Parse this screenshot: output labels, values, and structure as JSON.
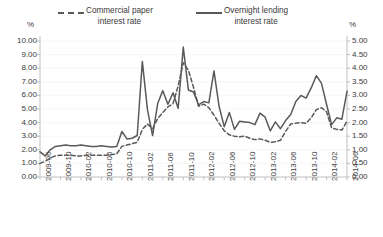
{
  "chart_data": {
    "type": "line",
    "title": "",
    "xlabel": "",
    "ylabel": "%",
    "y2label": "%",
    "grid": false,
    "legend_position": "top",
    "ylim": [
      0,
      10
    ],
    "y2lim": [
      0,
      5
    ],
    "yticks": [
      "0.00",
      "1.00",
      "2.00",
      "3.00",
      "4.00",
      "5.00",
      "6.00",
      "7.00",
      "8.00",
      "9.00",
      "10.00"
    ],
    "y2ticks": [
      "0.00",
      "0.50",
      "1.00",
      "1.50",
      "2.00",
      "2.50",
      "3.00",
      "3.50",
      "4.00",
      "4.50",
      "5.00"
    ],
    "xticklabels": [
      "2009-06",
      "2009-10",
      "2010-02",
      "2010-06",
      "2010-10",
      "2011-02",
      "2011-06",
      "2011-10",
      "2012-02",
      "2012-06",
      "2012-10",
      "2013-02",
      "2013-06",
      "2013-10",
      "2014-02",
      "2014-06"
    ],
    "x": [
      "2009-06",
      "2009-07",
      "2009-08",
      "2009-09",
      "2009-10",
      "2009-11",
      "2009-12",
      "2010-01",
      "2010-02",
      "2010-03",
      "2010-04",
      "2010-05",
      "2010-06",
      "2010-07",
      "2010-08",
      "2010-09",
      "2010-10",
      "2010-11",
      "2010-12",
      "2011-01",
      "2011-02",
      "2011-03",
      "2011-04",
      "2011-05",
      "2011-06",
      "2011-07",
      "2011-08",
      "2011-09",
      "2011-10",
      "2011-11",
      "2011-12",
      "2012-01",
      "2012-02",
      "2012-03",
      "2012-04",
      "2012-05",
      "2012-06",
      "2012-07",
      "2012-08",
      "2012-09",
      "2012-10",
      "2012-11",
      "2012-12",
      "2013-01",
      "2013-02",
      "2013-03",
      "2013-04",
      "2013-05",
      "2013-06",
      "2013-07",
      "2013-08",
      "2013-09",
      "2013-10",
      "2013-11",
      "2013-12",
      "2014-01",
      "2014-02",
      "2014-03",
      "2014-04",
      "2014-05",
      "2014-06"
    ],
    "series": [
      {
        "name": "Overnight lending interest rate",
        "style": "solid",
        "color": "#595959",
        "axis": "left",
        "values": [
          1.85,
          1.55,
          2.0,
          2.25,
          2.3,
          2.35,
          2.3,
          2.3,
          2.35,
          2.3,
          2.25,
          2.25,
          2.3,
          2.25,
          2.2,
          2.25,
          3.35,
          2.8,
          2.85,
          3.05,
          8.5,
          4.95,
          3.05,
          5.4,
          6.35,
          5.35,
          6.2,
          5.05,
          9.55,
          6.4,
          6.25,
          5.3,
          5.55,
          5.45,
          7.8,
          5.2,
          3.7,
          4.75,
          3.5,
          4.1,
          4.05,
          4.0,
          3.85,
          4.7,
          4.4,
          3.4,
          4.05,
          3.55,
          4.15,
          4.6,
          5.55,
          6.0,
          5.8,
          6.55,
          7.45,
          6.9,
          5.35,
          3.85,
          4.35,
          4.25,
          6.3
        ]
      },
      {
        "name": "Commercial paper interest rate",
        "style": "dashed",
        "color": "#595959",
        "axis": "left",
        "values": [
          1.0,
          1.15,
          1.4,
          1.55,
          1.6,
          1.6,
          1.6,
          1.55,
          1.55,
          1.6,
          1.6,
          1.6,
          1.6,
          1.6,
          1.65,
          1.7,
          2.25,
          2.35,
          2.45,
          2.55,
          3.5,
          3.9,
          3.55,
          4.3,
          4.75,
          5.15,
          5.4,
          6.7,
          8.4,
          7.85,
          6.6,
          5.2,
          5.35,
          5.1,
          4.55,
          3.95,
          3.4,
          3.1,
          3.0,
          2.95,
          3.0,
          2.85,
          2.75,
          2.8,
          2.7,
          2.55,
          2.6,
          2.7,
          3.35,
          3.9,
          3.95,
          4.0,
          3.95,
          4.35,
          4.95,
          5.1,
          4.8,
          3.6,
          3.5,
          3.45,
          4.1
        ]
      }
    ]
  }
}
